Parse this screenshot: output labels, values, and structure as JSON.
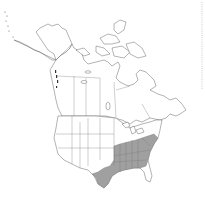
{
  "map": {
    "type": "species range map",
    "region": "North America",
    "shaded_region_label": "Southeastern United States",
    "colors": {
      "background": "#ffffff",
      "land": "#ffffff",
      "outline": "#555555",
      "range_fill": "#a0a0a0"
    },
    "shaded_states": [
      "TX",
      "OK",
      "AR",
      "LA",
      "MO",
      "IL",
      "IN",
      "OH",
      "KY",
      "TN",
      "MS",
      "AL",
      "GA",
      "SC",
      "NC",
      "VA",
      "WV",
      "MD",
      "DE",
      "PA",
      "NJ",
      "FL (north)"
    ]
  }
}
